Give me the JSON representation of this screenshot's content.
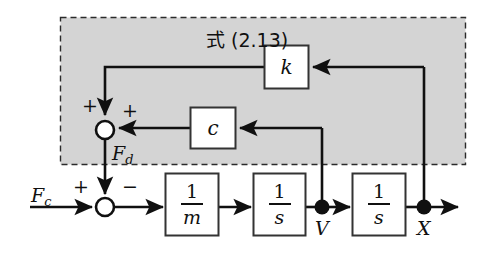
{
  "figure": {
    "type": "control-block-diagram",
    "title_group": "式 (2.13)",
    "background_color": "#ffffff",
    "group_fill_color": "#d4d4d4",
    "line_color": "#101010"
  },
  "group_box": {
    "caption": "式 (2.13)",
    "note": "dashed rectangle enclosing the spring-damper feedback path"
  },
  "blocks": [
    {
      "id": "gain-k",
      "label": "k",
      "kind": "gain"
    },
    {
      "id": "gain-c",
      "label": "c",
      "kind": "gain"
    },
    {
      "id": "inv-mass",
      "numerator": "1",
      "denominator": "m",
      "kind": "transfer"
    },
    {
      "id": "integrator-1",
      "numerator": "1",
      "denominator": "s",
      "kind": "transfer"
    },
    {
      "id": "integrator-2",
      "numerator": "1",
      "denominator": "s",
      "kind": "transfer"
    }
  ],
  "signals": {
    "input": "F",
    "input_sub": "c",
    "disturbance": "F",
    "disturbance_sub": "d",
    "velocity": "V",
    "position": "X"
  },
  "summing_junctions": [
    {
      "id": "upper-sum",
      "signs": [
        "+",
        "+"
      ],
      "sign_left": "+",
      "sign_right": "+",
      "output_label": "F_d"
    },
    {
      "id": "lower-sum",
      "signs": [
        "+",
        "-"
      ],
      "sign_left": "+",
      "sign_right": "−"
    }
  ],
  "labels": {
    "k": "k",
    "c": "c",
    "one": "1",
    "m": "m",
    "s": "s",
    "V": "V",
    "X": "X",
    "F": "F",
    "sub_c": "c",
    "sub_d": "d",
    "plus": "+",
    "minus": "−",
    "group": "式 (2.13)"
  }
}
